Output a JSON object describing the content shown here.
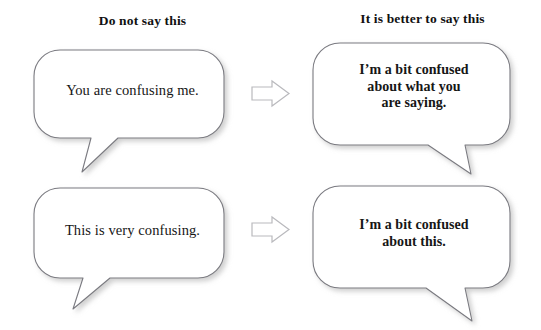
{
  "page": {
    "background_color": "#ffffff",
    "width": 541,
    "height": 330
  },
  "style": {
    "bubble_stroke_color": "#7a7a80",
    "bubble_fill_color": "#ffffff",
    "bubble_shadow_color": "#cfcfcf",
    "arrow_stroke_color": "#b9b9bd",
    "arrow_fill_color": "#ffffff",
    "text_color": "#161616"
  },
  "headers": {
    "left": "Do not say this",
    "right": "It is better to say this"
  },
  "rows": [
    {
      "id": "row-1",
      "bad": {
        "text": "You are confusing me.",
        "emphasis": "normal",
        "tail_direction": "down-left"
      },
      "arrow": {
        "icon": "right-arrow-icon",
        "direction": "right"
      },
      "good": {
        "text": "I’m a bit confused\nabout what you\nare saying.",
        "emphasis": "bold",
        "tail_direction": "down-right"
      }
    },
    {
      "id": "row-2",
      "bad": {
        "text": "This is very confusing.",
        "emphasis": "normal",
        "tail_direction": "down-left"
      },
      "arrow": {
        "icon": "right-arrow-icon",
        "direction": "right"
      },
      "good": {
        "text": "I’m a bit confused\nabout this.",
        "emphasis": "bold",
        "tail_direction": "down-right"
      }
    }
  ]
}
